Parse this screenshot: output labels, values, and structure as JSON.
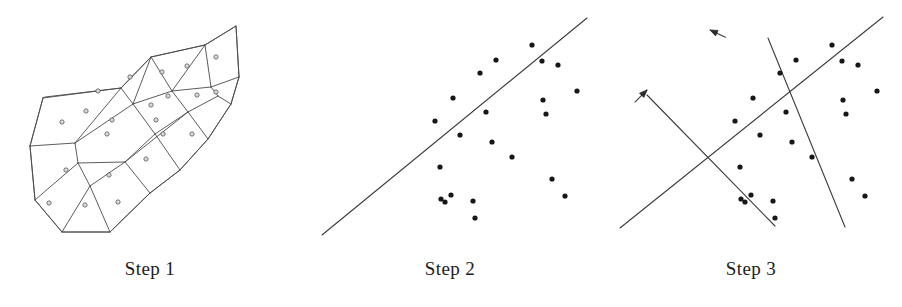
{
  "figure": {
    "width": 902,
    "height": 307,
    "background": "#ffffff",
    "line_color": "#3c3c3c",
    "dot_color": "#171717",
    "mesh_color": "#4a4a4a",
    "caption_color": "#1b1b1b"
  },
  "panels": [
    {
      "id": "step-1",
      "caption": "Step 1",
      "type": "mesh",
      "description": "irregular quadrilateral mesh / polygon partition with a small circle marker inside each cell"
    },
    {
      "id": "step-2",
      "caption": "Step 2",
      "type": "scatter",
      "description": "scatter of points with a single fitted diagonal line"
    },
    {
      "id": "step-3",
      "caption": "Step 3",
      "type": "scatter",
      "description": "same scatter with two crossed principal axis lines, each ending in an arrowhead"
    }
  ],
  "chart_data": [
    {
      "type": "mesh",
      "title": "Step 1",
      "xlabel": "",
      "ylabel": "",
      "grid": false,
      "legend": "none",
      "xlim": [
        0,
        300
      ],
      "ylim": [
        0,
        250
      ],
      "outline": [
        [
          43,
          98
        ],
        [
          45,
          97
        ],
        [
          121,
          88
        ],
        [
          151,
          57
        ],
        [
          205,
          45
        ],
        [
          236,
          26
        ],
        [
          239,
          77
        ],
        [
          231,
          104
        ],
        [
          208,
          139
        ],
        [
          180,
          170
        ],
        [
          150,
          193
        ],
        [
          110,
          232
        ],
        [
          62,
          232
        ],
        [
          35,
          200
        ],
        [
          30,
          146
        ],
        [
          43,
          98
        ]
      ],
      "edges": [
        [
          [
            43,
            98
          ],
          [
            121,
            88
          ]
        ],
        [
          [
            121,
            88
          ],
          [
            151,
            57
          ]
        ],
        [
          [
            151,
            57
          ],
          [
            205,
            45
          ]
        ],
        [
          [
            205,
            45
          ],
          [
            236,
            26
          ]
        ],
        [
          [
            236,
            26
          ],
          [
            239,
            77
          ]
        ],
        [
          [
            239,
            77
          ],
          [
            231,
            104
          ]
        ],
        [
          [
            231,
            104
          ],
          [
            208,
            139
          ]
        ],
        [
          [
            208,
            139
          ],
          [
            180,
            170
          ]
        ],
        [
          [
            180,
            170
          ],
          [
            150,
            193
          ]
        ],
        [
          [
            150,
            193
          ],
          [
            110,
            232
          ]
        ],
        [
          [
            110,
            232
          ],
          [
            62,
            232
          ]
        ],
        [
          [
            62,
            232
          ],
          [
            35,
            200
          ]
        ],
        [
          [
            35,
            200
          ],
          [
            30,
            146
          ]
        ],
        [
          [
            30,
            146
          ],
          [
            43,
            98
          ]
        ],
        [
          [
            30,
            146
          ],
          [
            75,
            143
          ]
        ],
        [
          [
            75,
            143
          ],
          [
            121,
            88
          ]
        ],
        [
          [
            75,
            143
          ],
          [
            78,
            163
          ]
        ],
        [
          [
            78,
            163
          ],
          [
            35,
            200
          ]
        ],
        [
          [
            78,
            163
          ],
          [
            90,
            186
          ]
        ],
        [
          [
            90,
            186
          ],
          [
            62,
            232
          ]
        ],
        [
          [
            90,
            186
          ],
          [
            110,
            232
          ]
        ],
        [
          [
            90,
            186
          ],
          [
            125,
            162
          ]
        ],
        [
          [
            125,
            162
          ],
          [
            150,
            193
          ]
        ],
        [
          [
            125,
            162
          ],
          [
            155,
            134
          ]
        ],
        [
          [
            155,
            134
          ],
          [
            180,
            170
          ]
        ],
        [
          [
            155,
            134
          ],
          [
            188,
            112
          ]
        ],
        [
          [
            188,
            112
          ],
          [
            208,
            139
          ]
        ],
        [
          [
            188,
            112
          ],
          [
            218,
            96
          ]
        ],
        [
          [
            218,
            96
          ],
          [
            231,
            104
          ]
        ],
        [
          [
            121,
            88
          ],
          [
            133,
            104
          ]
        ],
        [
          [
            133,
            104
          ],
          [
            75,
            143
          ]
        ],
        [
          [
            133,
            104
          ],
          [
            155,
            134
          ]
        ],
        [
          [
            133,
            104
          ],
          [
            151,
            57
          ]
        ],
        [
          [
            151,
            57
          ],
          [
            172,
            91
          ]
        ],
        [
          [
            172,
            91
          ],
          [
            133,
            104
          ]
        ],
        [
          [
            172,
            91
          ],
          [
            188,
            112
          ]
        ],
        [
          [
            172,
            91
          ],
          [
            205,
            45
          ]
        ],
        [
          [
            205,
            45
          ],
          [
            211,
            87
          ]
        ],
        [
          [
            211,
            87
          ],
          [
            172,
            91
          ]
        ],
        [
          [
            211,
            87
          ],
          [
            218,
            96
          ]
        ],
        [
          [
            211,
            87
          ],
          [
            239,
            77
          ]
        ],
        [
          [
            78,
            163
          ],
          [
            125,
            162
          ]
        ],
        [
          [
            125,
            162
          ],
          [
            188,
            112
          ]
        ]
      ],
      "cell_markers": [
        [
          62,
          122
        ],
        [
          86,
          111
        ],
        [
          98,
          91
        ],
        [
          130,
          77
        ],
        [
          162,
          72
        ],
        [
          187,
          66
        ],
        [
          216,
          57
        ],
        [
          112,
          120
        ],
        [
          151,
          105
        ],
        [
          168,
          96
        ],
        [
          197,
          95
        ],
        [
          216,
          92
        ],
        [
          107,
          134
        ],
        [
          66,
          170
        ],
        [
          109,
          175
        ],
        [
          146,
          159
        ],
        [
          163,
          134
        ],
        [
          192,
          134
        ],
        [
          85,
          205
        ],
        [
          49,
          203
        ],
        [
          118,
          202
        ],
        [
          156,
          120
        ]
      ]
    },
    {
      "type": "scatter",
      "title": "Step 2",
      "xlabel": "",
      "ylabel": "",
      "grid": false,
      "legend": "none",
      "xlim": [
        0,
        300
      ],
      "ylim": [
        0,
        250
      ],
      "points": [
        [
          135,
          121
        ],
        [
          153,
          98
        ],
        [
          160,
          135
        ],
        [
          180,
          73
        ],
        [
          186,
          112
        ],
        [
          192,
          142
        ],
        [
          196,
          60
        ],
        [
          212,
          157
        ],
        [
          242,
          61
        ],
        [
          243,
          100
        ],
        [
          246,
          114
        ],
        [
          252,
          179
        ],
        [
          258,
          65
        ],
        [
          265,
          196
        ],
        [
          277,
          91
        ],
        [
          232,
          45
        ],
        [
          140,
          167
        ],
        [
          151,
          195
        ],
        [
          173,
          201
        ],
        [
          175,
          218
        ],
        [
          145,
          202
        ],
        [
          141,
          199
        ]
      ],
      "points_exact": [
        [
          135,
          121
        ],
        [
          153,
          98
        ],
        [
          160,
          135
        ],
        [
          180,
          73
        ],
        [
          186,
          112
        ],
        [
          192,
          142
        ],
        [
          196,
          60
        ],
        [
          212,
          157
        ],
        [
          232,
          45
        ],
        [
          242,
          61
        ],
        [
          243,
          100
        ],
        [
          246,
          114
        ],
        [
          252,
          179
        ],
        [
          258,
          65
        ],
        [
          265,
          196
        ],
        [
          277,
          91
        ],
        [
          140,
          167
        ],
        [
          151,
          195
        ],
        [
          173,
          201
        ],
        [
          175,
          218
        ],
        [
          145,
          202
        ],
        [
          141,
          199
        ]
      ],
      "fit_line": {
        "x1": 22,
        "y1": 235,
        "x2": 287,
        "y2": 18
      }
    },
    {
      "type": "scatter",
      "title": "Step 3",
      "xlabel": "",
      "ylabel": "",
      "grid": false,
      "legend": "none",
      "xlim": [
        0,
        302
      ],
      "ylim": [
        0,
        250
      ],
      "points": [
        [
          135,
          121
        ],
        [
          153,
          98
        ],
        [
          160,
          135
        ],
        [
          180,
          73
        ],
        [
          186,
          112
        ],
        [
          192,
          142
        ],
        [
          196,
          60
        ],
        [
          212,
          157
        ],
        [
          232,
          45
        ],
        [
          242,
          61
        ],
        [
          243,
          100
        ],
        [
          246,
          114
        ],
        [
          252,
          179
        ],
        [
          258,
          65
        ],
        [
          265,
          196
        ],
        [
          277,
          91
        ],
        [
          140,
          167
        ],
        [
          151,
          195
        ],
        [
          173,
          201
        ],
        [
          175,
          218
        ],
        [
          145,
          202
        ],
        [
          141,
          199
        ]
      ],
      "primary_axis": {
        "x1": 22,
        "y1": 235,
        "x2": 287,
        "y2": 18,
        "arrow_at": "none"
      },
      "axis_major": {
        "x1": 20,
        "y1": 228,
        "x2": 283,
        "y2": 17,
        "arrow_at": "none"
      },
      "axis_minor": {
        "x1": 168,
        "y1": 38,
        "x2": 245,
        "y2": 227,
        "arrow_at": "start"
      },
      "axis_minor_2": {
        "x1": 47,
        "y1": 95,
        "x2": 175,
        "y2": 226,
        "arrow_at": "start"
      },
      "arrows": [
        {
          "name": "upper-left-arrow",
          "tip": [
            110,
            30
          ],
          "angle_deg": 205
        },
        {
          "name": "mid-left-arrow",
          "tip": [
            47,
            90
          ],
          "angle_deg": 315
        }
      ]
    }
  ]
}
